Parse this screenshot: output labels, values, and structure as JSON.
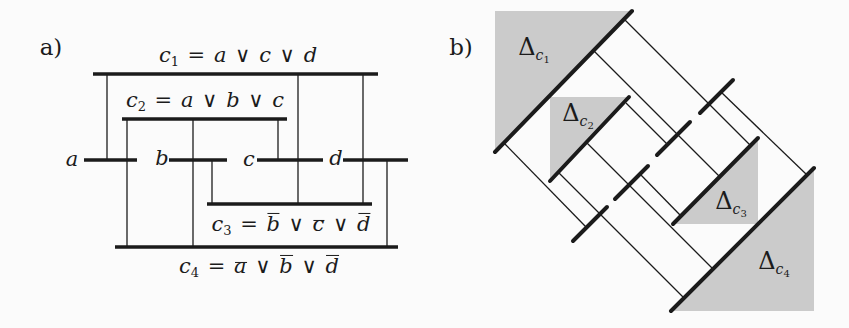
{
  "figure": {
    "colors": {
      "ink": "#1b1b1b",
      "gray": "#cbcbcb",
      "bg": "#fbfbfb"
    },
    "symbols": {
      "or": "∨",
      "eq": "=",
      "delta": "Δ",
      "clause_letter": "c"
    },
    "panel_a": {
      "tag": "a)",
      "tag_pos": {
        "x": 51,
        "y": 47
      },
      "mid_y": 160,
      "clauses": [
        {
          "id": "c1",
          "sub": "1",
          "literals": [
            {
              "v": "a",
              "neg": false
            },
            {
              "v": "c",
              "neg": false
            },
            {
              "v": "d",
              "neg": false
            }
          ],
          "line": {
            "x1": 93,
            "y": 74,
            "x2": 378
          },
          "label": {
            "x": 238,
            "y": 56
          }
        },
        {
          "id": "c2",
          "sub": "2",
          "literals": [
            {
              "v": "a",
              "neg": false
            },
            {
              "v": "b",
              "neg": false
            },
            {
              "v": "c",
              "neg": false
            }
          ],
          "line": {
            "x1": 122,
            "y": 119,
            "x2": 287
          },
          "label": {
            "x": 205,
            "y": 101
          }
        },
        {
          "id": "c3",
          "sub": "3",
          "literals": [
            {
              "v": "b",
              "neg": true
            },
            {
              "v": "c",
              "neg": true
            },
            {
              "v": "d",
              "neg": true
            }
          ],
          "line": {
            "x1": 207,
            "y": 204,
            "x2": 372
          },
          "label": {
            "x": 291,
            "y": 225
          }
        },
        {
          "id": "c4",
          "sub": "4",
          "literals": [
            {
              "v": "a",
              "neg": true
            },
            {
              "v": "b",
              "neg": true
            },
            {
              "v": "d",
              "neg": true
            }
          ],
          "line": {
            "x1": 115,
            "y": 247,
            "x2": 398
          },
          "label": {
            "x": 259,
            "y": 267
          }
        }
      ],
      "variables": [
        {
          "name": "a",
          "label": {
            "x": 72,
            "y": 159
          },
          "seg": {
            "x1": 84,
            "x2": 137
          }
        },
        {
          "name": "b",
          "label": {
            "x": 162,
            "y": 158
          },
          "seg": {
            "x1": 169,
            "x2": 227
          }
        },
        {
          "name": "c",
          "label": {
            "x": 249,
            "y": 159
          },
          "seg": {
            "x1": 257,
            "x2": 323
          }
        },
        {
          "name": "d",
          "label": {
            "x": 336,
            "y": 158
          },
          "seg": {
            "x1": 343,
            "x2": 408
          }
        }
      ],
      "connectors": [
        {
          "x": 107,
          "y1": 74,
          "y2": 160
        },
        {
          "x": 127,
          "y1": 119,
          "y2": 247
        },
        {
          "x": 193,
          "y1": 119,
          "y2": 247
        },
        {
          "x": 212,
          "y1": 160,
          "y2": 204
        },
        {
          "x": 278,
          "y1": 119,
          "y2": 160
        },
        {
          "x": 298,
          "y1": 74,
          "y2": 204
        },
        {
          "x": 363,
          "y1": 74,
          "y2": 204
        },
        {
          "x": 387,
          "y1": 160,
          "y2": 247
        }
      ]
    },
    "panel_b": {
      "tag": "b)",
      "tag_pos": {
        "x": 461,
        "y": 47
      },
      "clauses": [
        {
          "id": "c1",
          "sub": "1",
          "corner": "tl",
          "line": {
            "x1": 495,
            "y1": 152,
            "x2": 632,
            "y2": 11
          },
          "label": {
            "x": 534,
            "y": 50
          }
        },
        {
          "id": "c2",
          "sub": "2",
          "corner": "tl",
          "line": {
            "x1": 550,
            "y1": 181,
            "x2": 629,
            "y2": 97
          },
          "label": {
            "x": 578,
            "y": 116
          }
        },
        {
          "id": "c3",
          "sub": "3",
          "corner": "br",
          "line": {
            "x1": 673,
            "y1": 224,
            "x2": 758,
            "y2": 138
          },
          "label": {
            "x": 731,
            "y": 204
          }
        },
        {
          "id": "c4",
          "sub": "4",
          "corner": "br",
          "line": {
            "x1": 671,
            "y1": 311,
            "x2": 814,
            "y2": 168
          },
          "label": {
            "x": 774,
            "y": 264
          }
        }
      ],
      "variables": [
        {
          "name": "a",
          "seg": {
            "x1": 573,
            "y1": 241,
            "x2": 607,
            "y2": 207
          }
        },
        {
          "name": "b",
          "seg": {
            "x1": 615,
            "y1": 199,
            "x2": 648,
            "y2": 166
          }
        },
        {
          "name": "c",
          "seg": {
            "x1": 657,
            "y1": 155,
            "x2": 690,
            "y2": 122
          }
        },
        {
          "name": "d",
          "seg": {
            "x1": 700,
            "y1": 113,
            "x2": 733,
            "y2": 80
          }
        }
      ],
      "connectors": [
        {
          "x1": 503,
          "y1": 142,
          "x2": 586,
          "y2": 227
        },
        {
          "x1": 558,
          "y1": 172,
          "x2": 684,
          "y2": 298
        },
        {
          "x1": 587,
          "y1": 143,
          "x2": 713,
          "y2": 269
        },
        {
          "x1": 640,
          "y1": 174,
          "x2": 681,
          "y2": 216
        },
        {
          "x1": 594,
          "y1": 51,
          "x2": 720,
          "y2": 177
        },
        {
          "x1": 626,
          "y1": 103,
          "x2": 668,
          "y2": 145
        },
        {
          "x1": 625,
          "y1": 20,
          "x2": 751,
          "y2": 146
        },
        {
          "x1": 721,
          "y1": 92,
          "x2": 806,
          "y2": 174
        }
      ]
    }
  }
}
